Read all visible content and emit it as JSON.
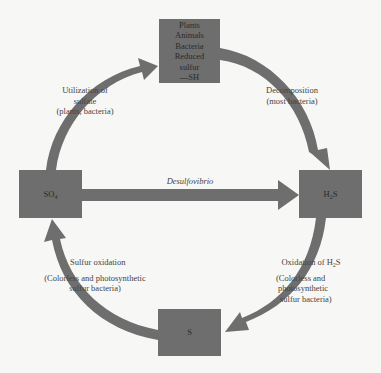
{
  "diagram": {
    "colors": {
      "node": "#6e6e6e",
      "arrow": "#6e6e6e",
      "background": "#f7f7f5",
      "text": "#444444"
    },
    "nodes": {
      "organic": {
        "lines": [
          "Plants",
          "Animals",
          "Bacteria",
          "Reduced",
          "sulfur",
          "—SH"
        ]
      },
      "so4": {
        "base": "SO",
        "sub": "4"
      },
      "h2s": {
        "pre": "H",
        "sub": "2",
        "post": "S"
      },
      "s": {
        "label": "S"
      }
    },
    "edges": {
      "utilization": {
        "line1": "Utilization of",
        "line2": "sulfate",
        "line3": "(plants, bacteria)",
        "from": "SO4",
        "to": "Organic sulfur"
      },
      "decomposition": {
        "line1": "Decomposition",
        "line2": "(most bacteria)",
        "from": "Organic sulfur",
        "to": "H2S"
      },
      "desulfovibrio": {
        "label": "Desulfovibrio",
        "from": "SO4",
        "to": "H2S"
      },
      "oxidation_h2s": {
        "line1_pre": "Oxidation of H",
        "line1_sub": "2",
        "line1_post": "S",
        "line2": "(Colorless and",
        "line3": "photosynthetic",
        "line4": "sulfur bacteria)",
        "from": "H2S",
        "to": "S"
      },
      "sulfur_oxidation": {
        "line1": "Sulfur oxidation",
        "line2": "(Colorless and photosynthetic",
        "line3": "sulfur bacteria)",
        "from": "S",
        "to": "SO4"
      }
    }
  }
}
